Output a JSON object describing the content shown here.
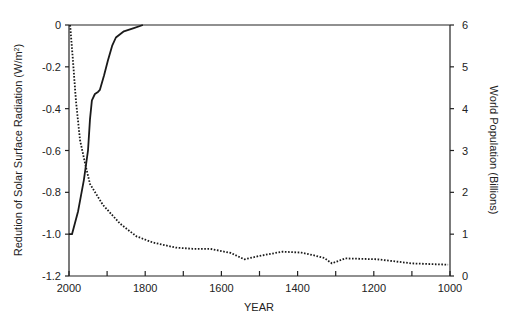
{
  "chart_data": {
    "type": "line",
    "title": "",
    "xlabel": "YEAR",
    "ylabel": "Redution of Solar Surface Radiation (W/m2)",
    "ylabel_superscript": "2",
    "ylabel_prefix": "Redution of Solar Surface Radiation (W/m",
    "ylabel_suffix": ")",
    "y2label": "World Population (Billions)",
    "xlim": [
      2000,
      1000
    ],
    "ylim": [
      -1.2,
      0
    ],
    "y2lim": [
      0,
      6
    ],
    "x_ticks": [
      2000,
      1900,
      1800,
      1700,
      1600,
      1500,
      1400,
      1300,
      1200,
      1100,
      1000
    ],
    "x_tick_labels": [
      "2000",
      "1800",
      "1600",
      "1400",
      "1200",
      "1000"
    ],
    "y_tick_labels": [
      "0",
      "-0.2",
      "-0.4",
      "-0.6",
      "-0.8",
      "-1.0",
      "-1.2"
    ],
    "y2_tick_labels": [
      "6",
      "5",
      "4",
      "3",
      "2",
      "1",
      "0"
    ],
    "grid": false,
    "legend": null,
    "series": [
      {
        "name": "Reduction of Solar Surface Radiation",
        "axis": "left",
        "style": "solid",
        "x": [
          2000,
          1992,
          1976,
          1961,
          1950,
          1945,
          1940,
          1932,
          1924,
          1919,
          1908,
          1898,
          1887,
          1877,
          1856,
          1830,
          1806
        ],
        "values": [
          -1.0,
          -1.0,
          -0.89,
          -0.74,
          -0.6,
          -0.45,
          -0.36,
          -0.33,
          -0.32,
          -0.31,
          -0.24,
          -0.17,
          -0.1,
          -0.06,
          -0.03,
          -0.015,
          0.0
        ]
      },
      {
        "name": "World Population",
        "axis": "right",
        "style": "dotted",
        "x": [
          1997,
          1990,
          1982,
          1971,
          1958,
          1945,
          1911,
          1866,
          1823,
          1780,
          1720,
          1675,
          1630,
          1575,
          1540,
          1500,
          1470,
          1440,
          1390,
          1360,
          1330,
          1310,
          1275,
          1190,
          1100,
          1005
        ],
        "values": [
          6.0,
          5.2,
          4.2,
          3.25,
          2.7,
          2.2,
          1.7,
          1.25,
          0.95,
          0.8,
          0.68,
          0.65,
          0.65,
          0.55,
          0.4,
          0.48,
          0.53,
          0.58,
          0.56,
          0.5,
          0.43,
          0.3,
          0.42,
          0.4,
          0.3,
          0.27
        ]
      }
    ]
  }
}
